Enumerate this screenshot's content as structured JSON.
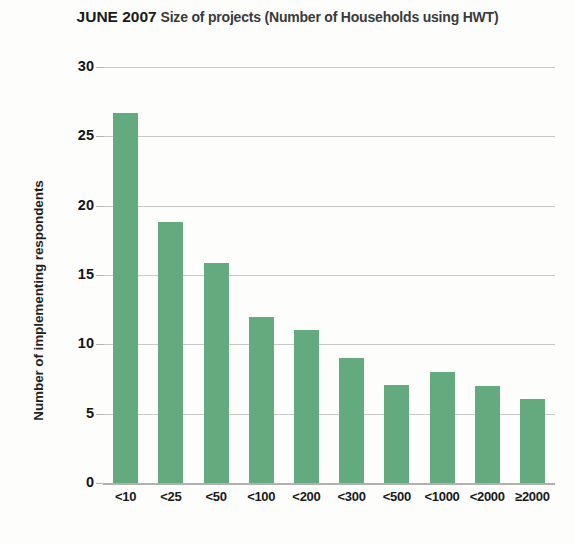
{
  "title": {
    "strong": "JUNE 2007",
    "rest": "Size of projects (Number of Households using HWT)"
  },
  "chart_data": {
    "type": "bar",
    "title": "JUNE 2007 Size of projects (Number of Households using HWT)",
    "xlabel": "",
    "ylabel": "Number of implementing respondents",
    "categories": [
      "<10",
      "<25",
      "<50",
      "<100",
      "<200",
      "<300",
      "<500",
      "<1000",
      "<2000",
      "≥2000"
    ],
    "values": [
      26.7,
      18.8,
      15.9,
      12.0,
      11.0,
      9.0,
      7.1,
      8.0,
      7.0,
      6.05
    ],
    "ylim": [
      0,
      30
    ],
    "yticks": [
      0,
      5,
      10,
      15,
      20,
      25,
      30
    ],
    "ytick_labels": [
      "0",
      "5",
      "10",
      "15",
      "20",
      "25",
      "30"
    ],
    "grid": true,
    "legend": false,
    "bar_color": "#63ab7f",
    "gridline_color": "#c8c8c8",
    "background_color": "#fdfdfc"
  }
}
